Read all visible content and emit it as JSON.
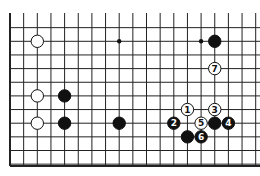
{
  "board": {
    "origin_x": 10,
    "origin_y": 14,
    "spacing": 13.65,
    "cols": 19,
    "rows": 12,
    "open_top": true,
    "open_right": true,
    "hoshi": [
      [
        9,
        2
      ],
      [
        15,
        2
      ]
    ],
    "stones": [
      {
        "col": 3,
        "row": 2,
        "color": "white",
        "label": ""
      },
      {
        "col": 16,
        "row": 2,
        "color": "black",
        "label": ""
      },
      {
        "col": 16,
        "row": 4,
        "color": "white",
        "label": "7"
      },
      {
        "col": 3,
        "row": 6,
        "color": "white",
        "label": ""
      },
      {
        "col": 5,
        "row": 6,
        "color": "black",
        "label": ""
      },
      {
        "col": 3,
        "row": 8,
        "color": "white",
        "label": ""
      },
      {
        "col": 5,
        "row": 8,
        "color": "black",
        "label": ""
      },
      {
        "col": 9,
        "row": 8,
        "color": "black",
        "label": ""
      },
      {
        "col": 14,
        "row": 7,
        "color": "white",
        "label": "1"
      },
      {
        "col": 13,
        "row": 8,
        "color": "black",
        "label": "2"
      },
      {
        "col": 16,
        "row": 7,
        "color": "white",
        "label": "3"
      },
      {
        "col": 17,
        "row": 8,
        "color": "black",
        "label": "4"
      },
      {
        "col": 15,
        "row": 8,
        "color": "white",
        "label": "5"
      },
      {
        "col": 16,
        "row": 8,
        "color": "black",
        "label": ""
      },
      {
        "col": 15,
        "row": 9,
        "color": "black",
        "label": "6"
      },
      {
        "col": 14,
        "row": 9,
        "color": "black",
        "label": ""
      }
    ]
  }
}
